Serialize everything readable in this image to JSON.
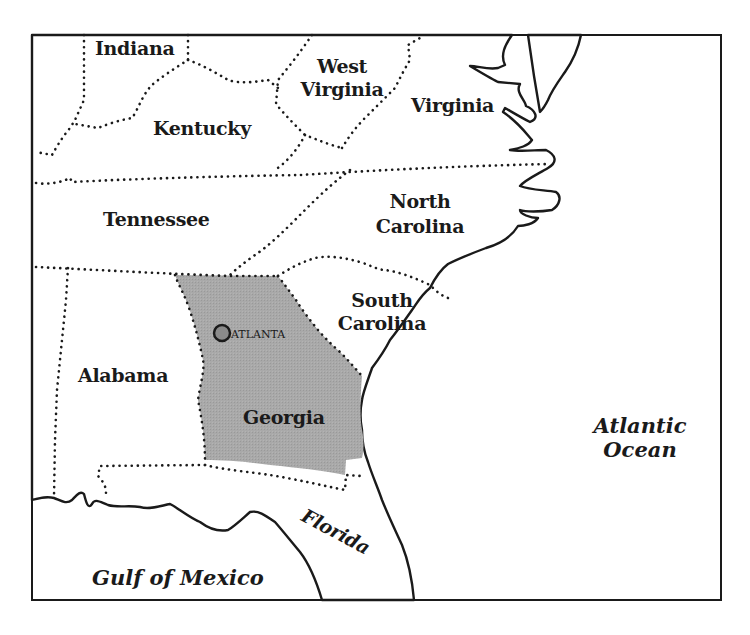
{
  "map": {
    "title": "Southeastern United States",
    "colors": {
      "land": "#b9b9b9",
      "highlight": "#a6a6a6",
      "water": "#ffffff",
      "border": "#1a1a1a",
      "city_marker": "#8a8a8a"
    },
    "states": [
      {
        "id": "indiana",
        "label": "Indiana"
      },
      {
        "id": "west-virginia",
        "label_line1": "West",
        "label_line2": "Virginia"
      },
      {
        "id": "virginia",
        "label": "Virginia"
      },
      {
        "id": "kentucky",
        "label": "Kentucky"
      },
      {
        "id": "tennessee",
        "label": "Tennessee"
      },
      {
        "id": "north-carolina",
        "label_line1": "North",
        "label_line2": "Carolina"
      },
      {
        "id": "south-carolina",
        "label_line1": "South",
        "label_line2": "Carolina"
      },
      {
        "id": "alabama",
        "label": "Alabama"
      },
      {
        "id": "georgia",
        "label": "Georgia",
        "highlighted": true
      },
      {
        "id": "florida",
        "label": "Florida"
      }
    ],
    "cities": [
      {
        "id": "atlanta",
        "label": "ATLANTA"
      }
    ],
    "water_bodies": [
      {
        "id": "atlantic",
        "label_line1": "Atlantic",
        "label_line2": "Ocean"
      },
      {
        "id": "gulf",
        "label": "Gulf of Mexico"
      }
    ]
  }
}
